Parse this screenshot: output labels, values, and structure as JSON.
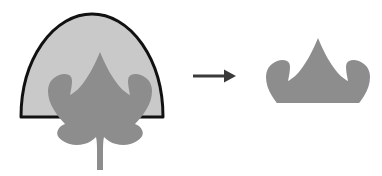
{
  "figure": {
    "type": "geometric-set-operation",
    "background_color": "#ffffff",
    "canvas": {
      "width": 382,
      "height": 176
    }
  },
  "left_group": {
    "name": "input-shapes",
    "dome": {
      "label": "semicircle-dome",
      "fill_color": "#c9c9c9",
      "stroke_color": "#111111",
      "stroke_width": 3,
      "center_x": 92,
      "baseline_y": 117,
      "radius_x": 71,
      "radius_y": 103,
      "left_x": 21,
      "right_x": 163,
      "top_y": 14
    },
    "leaf": {
      "label": "maple-leaf",
      "fill_color": "#8d8d8d",
      "center_x": 100,
      "tip_y": 52,
      "stem_bottom_y": 170,
      "left_x": 50,
      "right_x": 152,
      "lobe_count": 5
    }
  },
  "arrow": {
    "label": "transformation-arrow",
    "color": "#3a3a3a",
    "start_x": 193,
    "end_x": 236,
    "y": 76,
    "shaft_width": 3,
    "head_length": 12,
    "head_width": 13
  },
  "right_group": {
    "name": "result-shape",
    "clipped_leaf": {
      "label": "clipped-leaf-result",
      "fill_color": "#8d8d8d",
      "center_x": 318,
      "top_y": 47,
      "baseline_y": 103,
      "left_x": 266,
      "right_x": 368,
      "visible_lobe_count": 3
    }
  },
  "colors": {
    "dome_fill": "#c9c9c9",
    "dome_stroke": "#111111",
    "leaf_fill": "#8d8d8d",
    "arrow": "#3a3a3a",
    "background": "#ffffff"
  }
}
